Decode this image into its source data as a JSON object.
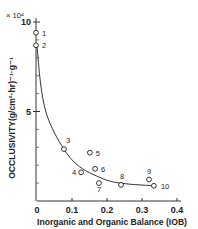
{
  "chart_data": {
    "type": "scatter",
    "title": "",
    "xlabel": "Inorganic and Organic Balance (IOB)",
    "ylabel": "OCCLUSIVITY(g/cm²·hr)⁻¹·g⁻¹",
    "y_multiplier": "× 10⁴",
    "xlim": [
      0,
      0.4
    ],
    "ylim": [
      0,
      10
    ],
    "x_ticks": [
      "0",
      "0.1",
      "0.2",
      "0.3",
      "0.4"
    ],
    "y_ticks": [
      "0",
      "5",
      "10"
    ],
    "y_minor_ticks": [
      1,
      2,
      3,
      4,
      6,
      7,
      8,
      9
    ],
    "grid": false,
    "legend": null,
    "marker": "open-circle",
    "series": [
      {
        "name": "samples",
        "points": [
          {
            "label": "1",
            "x": 0.0,
            "y": 9.4
          },
          {
            "label": "2",
            "x": 0.0,
            "y": 8.7
          },
          {
            "label": "3",
            "x": 0.077,
            "y": 2.9
          },
          {
            "label": "4",
            "x": 0.126,
            "y": 1.6
          },
          {
            "label": "5",
            "x": 0.151,
            "y": 2.7
          },
          {
            "label": "6",
            "x": 0.166,
            "y": 1.8
          },
          {
            "label": "7",
            "x": 0.177,
            "y": 1.0
          },
          {
            "label": "8",
            "x": 0.24,
            "y": 0.9
          },
          {
            "label": "9",
            "x": 0.32,
            "y": 1.2
          },
          {
            "label": "10",
            "x": 0.334,
            "y": 0.85
          }
        ]
      }
    ],
    "fit_curve": {
      "description": "hyperbolic-like decreasing fitted curve from point 2 to point 10",
      "points": [
        [
          0.0,
          8.7
        ],
        [
          0.01,
          6.6
        ],
        [
          0.025,
          5.0
        ],
        [
          0.05,
          3.8
        ],
        [
          0.077,
          2.9
        ],
        [
          0.1,
          2.3
        ],
        [
          0.13,
          1.8
        ],
        [
          0.17,
          1.4
        ],
        [
          0.21,
          1.1
        ],
        [
          0.26,
          0.95
        ],
        [
          0.334,
          0.85
        ]
      ]
    }
  }
}
